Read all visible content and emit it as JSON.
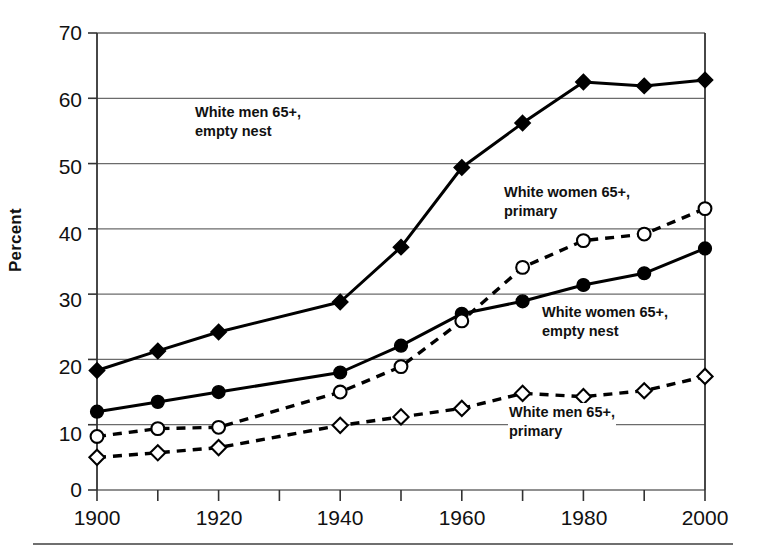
{
  "chart_data": {
    "type": "line",
    "title": "",
    "subtitle": "",
    "xlabel": "",
    "ylabel": "Percent",
    "x": [
      1900,
      1910,
      1920,
      1930,
      1940,
      1950,
      1960,
      1970,
      1980,
      1990,
      2000
    ],
    "xlim": [
      1900,
      2000
    ],
    "ylim": [
      0,
      70
    ],
    "xticks": [
      "1900",
      "1920",
      "1940",
      "1960",
      "1980",
      "2000"
    ],
    "xtick_values": [
      1900,
      1920,
      1940,
      1960,
      1980,
      2000
    ],
    "yticks": [
      "0",
      "10",
      "20",
      "30",
      "40",
      "50",
      "60",
      "70"
    ],
    "ytick_values": [
      0,
      10,
      20,
      30,
      40,
      50,
      60,
      70
    ],
    "grid": "horizontal",
    "legend_position": "inline-annotations",
    "series": [
      {
        "name": "White men 65+, empty nest",
        "marker": "filled-diamond",
        "line": "solid",
        "color": "#000000",
        "x": [
          1900,
          1910,
          1920,
          1940,
          1950,
          1960,
          1970,
          1980,
          1990,
          2000
        ],
        "values": [
          18.3,
          21.3,
          24.2,
          28.8,
          37.2,
          49.4,
          56.2,
          62.5,
          61.9,
          62.8
        ]
      },
      {
        "name": "White women 65+, empty nest",
        "marker": "filled-circle",
        "line": "solid",
        "color": "#000000",
        "x": [
          1900,
          1910,
          1920,
          1940,
          1950,
          1960,
          1970,
          1980,
          1990,
          2000
        ],
        "values": [
          12.0,
          13.5,
          15.0,
          18.0,
          22.1,
          27.0,
          28.9,
          31.4,
          33.2,
          37.0
        ]
      },
      {
        "name": "White women 65+, primary",
        "marker": "open-circle",
        "line": "dashed",
        "color": "#000000",
        "x": [
          1900,
          1910,
          1920,
          1940,
          1950,
          1960,
          1970,
          1980,
          1990,
          2000
        ],
        "values": [
          8.2,
          9.4,
          9.6,
          15.0,
          18.9,
          25.9,
          34.1,
          38.2,
          39.2,
          43.1
        ]
      },
      {
        "name": "White men 65+, primary",
        "marker": "open-diamond",
        "line": "dashed",
        "color": "#000000",
        "x": [
          1900,
          1910,
          1920,
          1940,
          1950,
          1960,
          1970,
          1980,
          1990,
          2000
        ],
        "values": [
          5.0,
          5.7,
          6.5,
          9.9,
          11.2,
          12.5,
          14.8,
          14.3,
          15.2,
          17.4
        ]
      }
    ],
    "annotations": [
      {
        "text_line1": "White men 65+",
        "text_line2": "empty nest",
        "label": "White men 65+,\nempty nest"
      },
      {
        "text_line1": "White women 65+",
        "text_line2": "primary",
        "label": "White women 65+,\nprimary"
      },
      {
        "text_line1": "White women 65+",
        "text_line2": "empty nest",
        "label": "White women 65+,\nempty nest"
      },
      {
        "text_line1": "White men 65+",
        "text_line2": "primary",
        "label": "White men 65+,\nprimary"
      }
    ]
  },
  "annotation_text": {
    "men_empty_l1": "White men 65+,",
    "men_empty_l2": "empty nest",
    "women_primary_l1": "White women 65+,",
    "women_primary_l2": "primary",
    "women_empty_l1": "White women 65+,",
    "women_empty_l2": "empty nest",
    "men_primary_l1": "White men 65+,",
    "men_primary_l2": "primary"
  },
  "axis": {
    "ylabel": "Percent",
    "yticks": [
      "70",
      "60",
      "50",
      "40",
      "30",
      "20",
      "10",
      "0"
    ],
    "xticks": [
      "1900",
      "1920",
      "1940",
      "1960",
      "1980",
      "2000"
    ]
  },
  "colors": {
    "ink": "#000000",
    "grid": "#6b6b6b",
    "background": "#ffffff"
  }
}
